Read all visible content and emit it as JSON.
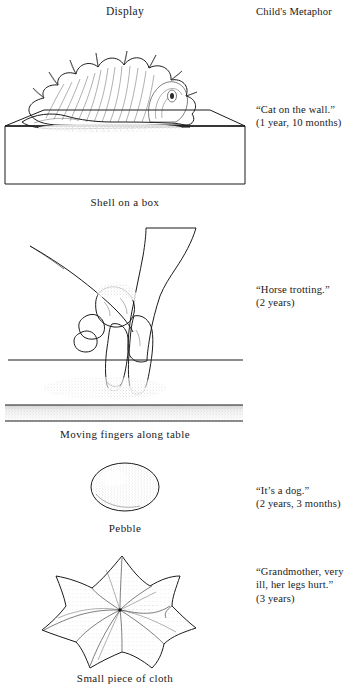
{
  "headers": {
    "display": "Display",
    "metaphor": "Child's Metaphor"
  },
  "rows": [
    {
      "id": "shell",
      "illustration": "shell-on-box-drawing",
      "caption": "Shell on a box",
      "metaphor_quote": "“Cat on the wall.”",
      "metaphor_age": "(1 year, 10 months)"
    },
    {
      "id": "hand",
      "illustration": "hand-walking-fingers-on-table-drawing",
      "caption": "Moving fingers along table",
      "metaphor_quote": "“Horse trotting.”",
      "metaphor_age": "(2 years)"
    },
    {
      "id": "pebble",
      "illustration": "pebble-drawing",
      "caption": "Pebble",
      "metaphor_quote": "“It’s a dog.”",
      "metaphor_age": "(2 years, 3 months)"
    },
    {
      "id": "cloth",
      "illustration": "draped-cloth-drawing",
      "caption": "Small piece of cloth",
      "metaphor_quote": "“Grandmother, very ill, her legs hurt.”",
      "metaphor_age": "(3 years)"
    }
  ],
  "colors": {
    "ink": "#1b1b1b",
    "page": "#ffffff",
    "text": "#1a1a1a"
  }
}
